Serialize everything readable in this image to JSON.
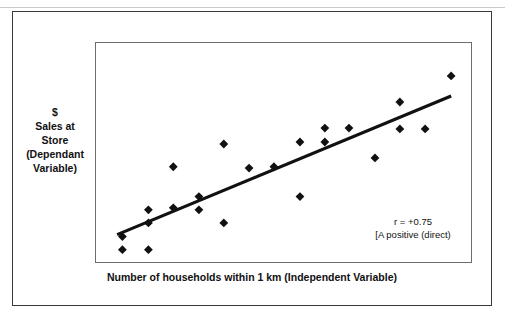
{
  "figure": {
    "y_axis_label_lines": [
      "$",
      "Sales at",
      "Store",
      "(Dependant",
      "Variable)"
    ],
    "x_axis_label": "Number of households within 1 km (Independent Variable)",
    "annotation_lines": [
      "r = +0.75",
      "[A positive (direct)"
    ],
    "marker_color": "#111111",
    "line_color": "#111111",
    "plot_border_color": "#6d6d6d",
    "outer_border_color": "#3a3a3a"
  },
  "chart_data": {
    "type": "scatter",
    "title": "",
    "xlabel": "Number of households within 1 km (Independent Variable)",
    "ylabel": "$ Sales at Store (Dependant Variable)",
    "xlim": [
      0,
      100
    ],
    "ylim": [
      0,
      100
    ],
    "grid": false,
    "legend": "none",
    "correlation": "r = +0.75",
    "annotation": "[A positive (direct)",
    "points": [
      {
        "x": 7.0,
        "y": 12.4
      },
      {
        "x": 7.0,
        "y": 6.5
      },
      {
        "x": 13.9,
        "y": 6.5
      },
      {
        "x": 13.9,
        "y": 24.5
      },
      {
        "x": 13.9,
        "y": 18.6
      },
      {
        "x": 20.5,
        "y": 25.4
      },
      {
        "x": 20.5,
        "y": 44.0
      },
      {
        "x": 27.3,
        "y": 30.5
      },
      {
        "x": 27.3,
        "y": 24.5
      },
      {
        "x": 33.9,
        "y": 54.3
      },
      {
        "x": 33.9,
        "y": 18.6
      },
      {
        "x": 40.6,
        "y": 43.4
      },
      {
        "x": 47.2,
        "y": 44.0
      },
      {
        "x": 54.1,
        "y": 55.2
      },
      {
        "x": 54.1,
        "y": 30.5
      },
      {
        "x": 60.7,
        "y": 61.5
      },
      {
        "x": 60.7,
        "y": 55.2
      },
      {
        "x": 67.1,
        "y": 61.5
      },
      {
        "x": 74.0,
        "y": 48.0
      },
      {
        "x": 80.6,
        "y": 73.3
      },
      {
        "x": 80.6,
        "y": 61.1
      },
      {
        "x": 87.3,
        "y": 61.1
      },
      {
        "x": 94.2,
        "y": 85.1
      }
    ],
    "trend_line": {
      "label": "line of best fit",
      "x0": 5.6,
      "y0": 13.3,
      "x1": 94.2,
      "y1": 76.0
    }
  }
}
